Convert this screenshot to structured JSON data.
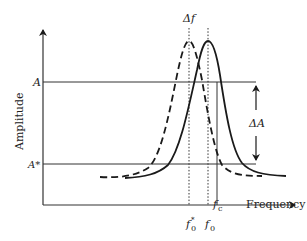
{
  "diagram": {
    "type": "resonance-shift",
    "axes": {
      "y_label": "Amplitude",
      "x_label": "Frequency"
    },
    "levels": {
      "A": "A",
      "A_star": "A*"
    },
    "frequency_marks": {
      "delta_f": "Δf",
      "f_c": "f",
      "f_c_sub": "c",
      "f0": "f",
      "f0_sub": "0",
      "f0_star": "f",
      "f0_star_sub": "0",
      "f0_star_sup": "*"
    },
    "annotation": {
      "delta_A": "ΔA"
    },
    "curves": [
      {
        "name": "shifted-resonance",
        "style": "dashed",
        "peak_at": "f0*"
      },
      {
        "name": "original-resonance",
        "style": "solid",
        "peak_at": "f0"
      }
    ],
    "colors": {
      "line": "#1a1a1a",
      "axis": "#333333",
      "text": "#222222"
    }
  }
}
